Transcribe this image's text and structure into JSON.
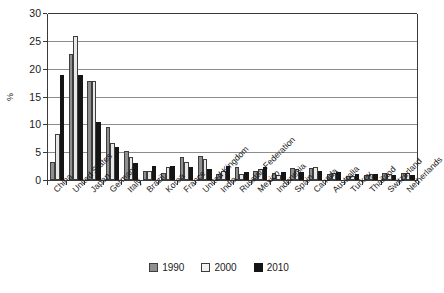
{
  "chart_data": {
    "type": "bar",
    "title": "",
    "xlabel": "",
    "ylabel": "%",
    "ylim": [
      0,
      30
    ],
    "yticks": [
      0,
      5,
      10,
      15,
      20,
      25,
      30
    ],
    "grid": true,
    "legend_position": "bottom",
    "categories": [
      "China",
      "United States",
      "Japan",
      "Germany",
      "Italy",
      "Brazil",
      "Korea",
      "France",
      "United Kingdom",
      "India",
      "Russian Federation",
      "Mexico",
      "Indonesia",
      "Spain",
      "Canada",
      "Australia",
      "Turkey",
      "Thailand",
      "Switzerland",
      "Netherlands"
    ],
    "series": [
      {
        "name": "1990",
        "color": "#8f8f8f",
        "values": [
          3.2,
          22.6,
          17.8,
          9.5,
          5.2,
          1.6,
          1.3,
          4.2,
          4.3,
          1.1,
          2.3,
          1.6,
          1.2,
          2.1,
          2.2,
          1.0,
          0.7,
          0.9,
          1.2,
          1.3
        ]
      },
      {
        "name": "2000",
        "color": "#e8e8e8",
        "values": [
          8.2,
          25.9,
          17.8,
          6.6,
          4.2,
          1.6,
          2.3,
          3.2,
          3.7,
          1.7,
          1.0,
          2.0,
          0.9,
          2.0,
          2.3,
          1.2,
          0.8,
          1.0,
          1.0,
          1.2
        ]
      },
      {
        "name": "2010",
        "color": "#151515",
        "values": [
          18.8,
          18.8,
          10.5,
          6.0,
          3.0,
          2.6,
          2.6,
          2.4,
          2.0,
          2.5,
          1.5,
          2.3,
          1.5,
          1.4,
          1.6,
          1.4,
          1.1,
          1.0,
          0.9,
          0.9
        ]
      }
    ]
  },
  "legend": {
    "items": [
      {
        "label": "1990"
      },
      {
        "label": "2000"
      },
      {
        "label": "2010"
      }
    ]
  }
}
